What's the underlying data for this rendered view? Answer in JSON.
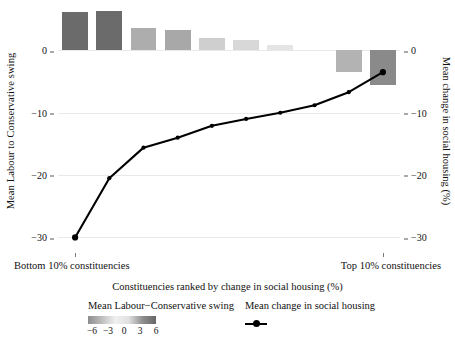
{
  "chart_data": {
    "type": "bar",
    "title": "",
    "xlabel": "Constituencies ranked by change in social housing (%)",
    "ylabel_left": "Mean Labour to Conservative swing",
    "ylabel_right": "Mean change in social housing (%)",
    "grid": true,
    "legend_position": "bottom",
    "categories": [
      "1",
      "2",
      "3",
      "4",
      "5",
      "6",
      "7",
      "8",
      "9",
      "10"
    ],
    "x_tick_labels": [
      "Bottom 10% constituencies",
      "Top 10% constituencies"
    ],
    "y_ticks_left": [
      "0",
      "−10",
      "−20",
      "−30"
    ],
    "y_ticks_right": [
      "0",
      "−10",
      "−20",
      "−30"
    ],
    "y_tick_values": [
      0,
      -10,
      -20,
      -30
    ],
    "ylim": [
      -32.5,
      6.8
    ],
    "series": [
      {
        "name": "Mean Labour−Conservative swing",
        "type": "bar",
        "values": [
          6.2,
          6.3,
          3.6,
          3.2,
          2.0,
          1.6,
          0.9,
          0.0,
          -3.5,
          -5.6
        ],
        "colors": [
          "#6b6b6b",
          "#6b6b6b",
          "#adadad",
          "#a8a8a8",
          "#cfcfcf",
          "#d8d8d8",
          "#e4e4e4",
          "#f2f2f2",
          "#b3b3b3",
          "#8a8a8a"
        ]
      },
      {
        "name": "Mean change in social housing",
        "type": "line",
        "values": [
          -30.0,
          -20.5,
          -15.6,
          -14.0,
          -12.1,
          -11.0,
          -10.0,
          -8.8,
          -6.7,
          -3.5
        ],
        "color": "#000000"
      }
    ]
  },
  "legend": {
    "swing": {
      "label": "Mean Labour−Conservative swing",
      "colorbar_ticks": [
        "−6",
        "−3",
        "0",
        "3",
        "6"
      ],
      "colorbar_stops": [
        "#8c8c8c",
        "#bdbdbd",
        "#f0f0f0",
        "#e0e0e0",
        "#8f8f8f",
        "#666666"
      ]
    },
    "housing": {
      "label": "Mean change in social housing",
      "marker": "line-with-point-marker"
    }
  }
}
